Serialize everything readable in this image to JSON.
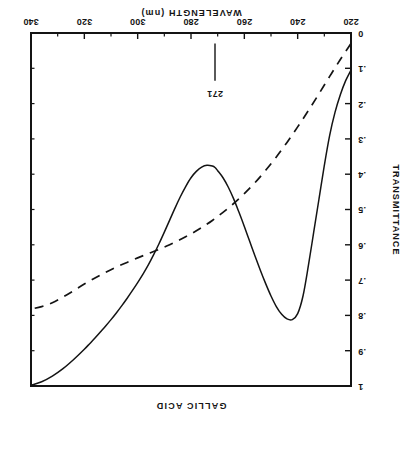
{
  "chart_data": {
    "type": "line",
    "title": "GALLIC ACID",
    "subtitle": "",
    "xlabel": "WAVELENGTH  (nm)",
    "ylabel": "TRANSMITTANCE",
    "xlim": [
      220,
      340
    ],
    "ylim": [
      0,
      1
    ],
    "xticks": [
      220,
      240,
      260,
      280,
      300,
      320,
      340
    ],
    "xtick_labels": [
      "220",
      "240",
      "260",
      "280",
      "300",
      "320",
      "340"
    ],
    "x_minor_ticks": [
      230,
      250,
      270,
      290,
      310,
      330
    ],
    "yticks": [
      0,
      0.1,
      0.2,
      0.3,
      0.4,
      0.5,
      0.6,
      0.7,
      0.8,
      0.9,
      1
    ],
    "ytick_labels": [
      "0",
      ".1",
      ".2",
      ".3",
      ".4",
      ".5",
      ".6",
      ".7",
      ".8",
      ".9",
      "1"
    ],
    "grid": false,
    "legend_position": "none",
    "rotation_deg": 180,
    "annotations": [
      {
        "text": "271",
        "x": 271,
        "y": 0.17,
        "pointer_from_y": 0.03,
        "pointer_to_y": 0.135,
        "note": "absorption maximum / transmittance minimum wavelength"
      }
    ],
    "series": [
      {
        "name": "solid-curve",
        "style": "solid",
        "color": "#141414",
        "x": [
          220,
          222,
          224,
          226,
          228,
          230,
          232,
          234,
          236,
          238,
          240,
          242,
          244,
          246,
          248,
          250,
          252,
          254,
          256,
          258,
          260,
          262,
          264,
          266,
          268,
          270,
          271,
          272,
          274,
          276,
          278,
          280,
          282,
          284,
          286,
          288,
          290,
          292,
          294,
          296,
          298,
          300,
          302,
          304,
          306,
          308,
          310,
          312,
          314,
          316,
          318,
          320,
          324,
          328,
          332,
          336,
          340
        ],
        "y": [
          0.105,
          0.135,
          0.175,
          0.225,
          0.29,
          0.375,
          0.47,
          0.565,
          0.66,
          0.745,
          0.795,
          0.812,
          0.81,
          0.797,
          0.775,
          0.745,
          0.71,
          0.672,
          0.632,
          0.59,
          0.548,
          0.508,
          0.47,
          0.437,
          0.41,
          0.39,
          0.381,
          0.377,
          0.375,
          0.38,
          0.392,
          0.41,
          0.435,
          0.464,
          0.496,
          0.53,
          0.564,
          0.597,
          0.628,
          0.657,
          0.683,
          0.707,
          0.73,
          0.752,
          0.773,
          0.793,
          0.812,
          0.83,
          0.847,
          0.864,
          0.88,
          0.896,
          0.925,
          0.951,
          0.972,
          0.988,
          0.998
        ]
      },
      {
        "name": "dashed-curve",
        "style": "dashed",
        "color": "#141414",
        "x": [
          220,
          224,
          228,
          232,
          236,
          240,
          244,
          248,
          252,
          256,
          260,
          264,
          268,
          272,
          276,
          280,
          284,
          288,
          292,
          296,
          300,
          304,
          308,
          312,
          316,
          320,
          324,
          328,
          332,
          336,
          340
        ],
        "y": [
          0.03,
          0.075,
          0.123,
          0.172,
          0.22,
          0.266,
          0.31,
          0.351,
          0.389,
          0.424,
          0.455,
          0.483,
          0.508,
          0.531,
          0.551,
          0.569,
          0.585,
          0.6,
          0.613,
          0.625,
          0.637,
          0.65,
          0.663,
          0.678,
          0.694,
          0.711,
          0.73,
          0.748,
          0.764,
          0.775,
          0.782
        ]
      }
    ]
  }
}
